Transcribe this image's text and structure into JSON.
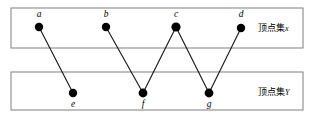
{
  "diagram": {
    "type": "bipartite-graph",
    "canvas": {
      "width": 312,
      "height": 127
    },
    "sets": [
      {
        "id": "X",
        "label_cjk": "顶点集",
        "label_var": "x",
        "box": {
          "x": 11,
          "y": 8,
          "width": 292,
          "height": 40
        },
        "label_pos": {
          "x": 258,
          "y": 31
        }
      },
      {
        "id": "Y",
        "label_cjk": "顶点集",
        "label_var": "Y",
        "box": {
          "x": 11,
          "y": 72,
          "width": 292,
          "height": 38
        },
        "label_pos": {
          "x": 258,
          "y": 95
        }
      }
    ],
    "vertices": [
      {
        "id": "a",
        "label": "a",
        "set": "X",
        "x": 39,
        "y": 27,
        "r": 4.2,
        "label_x": 39,
        "label_y": 17
      },
      {
        "id": "b",
        "label": "b",
        "set": "X",
        "x": 106,
        "y": 27,
        "r": 4.2,
        "label_x": 106,
        "label_y": 17
      },
      {
        "id": "c",
        "label": "c",
        "set": "X",
        "x": 176,
        "y": 27,
        "r": 4.6,
        "label_x": 176,
        "label_y": 17
      },
      {
        "id": "d",
        "label": "d",
        "set": "X",
        "x": 241,
        "y": 28,
        "r": 4.2,
        "label_x": 241,
        "label_y": 17
      },
      {
        "id": "e",
        "label": "e",
        "set": "Y",
        "x": 73,
        "y": 93,
        "r": 4.2,
        "label_x": 73,
        "label_y": 107
      },
      {
        "id": "f",
        "label": "f",
        "set": "Y",
        "x": 143,
        "y": 93,
        "r": 4.4,
        "label_x": 143,
        "label_y": 107
      },
      {
        "id": "g",
        "label": "g",
        "set": "Y",
        "x": 209,
        "y": 93,
        "r": 4.4,
        "label_x": 209,
        "label_y": 107
      }
    ],
    "edges": [
      {
        "id": "a-e",
        "from": "a",
        "to": "e"
      },
      {
        "id": "b-f",
        "from": "b",
        "to": "f"
      },
      {
        "id": "c-f",
        "from": "c",
        "to": "f"
      },
      {
        "id": "c-g",
        "from": "c",
        "to": "g"
      },
      {
        "id": "d-g",
        "from": "d",
        "to": "g"
      }
    ],
    "colors": {
      "vertex": "#000000",
      "edge": "#1a1a1a",
      "box_stroke": "#8a8a8a",
      "background": "#ffffff"
    }
  }
}
